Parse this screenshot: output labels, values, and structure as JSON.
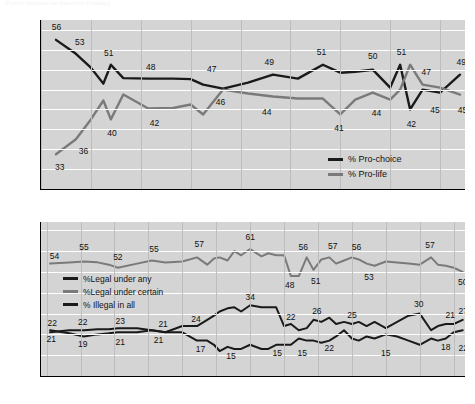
{
  "page": {
    "faint_header": "Public Opinion on Abortion (Gallup)"
  },
  "charts": [
    {
      "id": "chart-pro-choice-pro-life",
      "type": "line",
      "title": "",
      "xlabel": "",
      "ylabel": "",
      "xlim": [
        1995,
        2012
      ],
      "ylim": [
        26,
        60
      ],
      "yticks": [
        26,
        30,
        34,
        38,
        42,
        46,
        50,
        54,
        58
      ],
      "xticks": [
        1995,
        1997,
        1999,
        2001,
        2003,
        2005,
        2007,
        2009,
        2011
      ],
      "grid": "horizontal-and-vertical",
      "legend_position": "bottom-right-inside",
      "series": [
        {
          "name": "% Pro-choice",
          "color": "#1a1a1a",
          "x": [
            1995.6,
            1996.4,
            1997.0,
            1997.5,
            1997.8,
            1998.3,
            1999.3,
            2000.3,
            2001.0,
            2001.5,
            2002.3,
            2003.3,
            2004.3,
            2005.3,
            2006.3,
            2007.0,
            2007.6,
            2008.3,
            2009.0,
            2009.4,
            2009.8,
            2010.3,
            2011.0,
            2011.8
          ],
          "values": [
            56,
            53.2,
            50.4,
            47.2,
            51,
            48.3,
            48.2,
            48.2,
            48.1,
            47,
            46.2,
            47.4,
            49,
            48.2,
            51,
            49.4,
            49.6,
            50,
            46.4,
            51,
            42,
            46,
            45.4,
            49
          ]
        },
        {
          "name": "% Pro-life",
          "color": "#7a7a7a",
          "x": [
            1995.6,
            1996.4,
            1997.0,
            1997.5,
            1997.8,
            1998.3,
            1999.3,
            2000.3,
            2001.0,
            2001.5,
            2002.3,
            2003.3,
            2004.3,
            2005.3,
            2006.3,
            2007.0,
            2007.6,
            2008.3,
            2009.0,
            2009.4,
            2009.8,
            2010.3,
            2011.0,
            2011.8
          ],
          "values": [
            33,
            36,
            40,
            43.8,
            40,
            45,
            42.2,
            42.3,
            43,
            41,
            46,
            45.2,
            44.6,
            44.2,
            44.2,
            41,
            44,
            45.4,
            44,
            46,
            51,
            47,
            46.4,
            45
          ]
        }
      ],
      "data_labels": [
        {
          "text": "56",
          "x": 1995.62,
          "y": 58.6,
          "series": "% Pro-choice"
        },
        {
          "text": "53",
          "x": 1996.55,
          "y": 55.6,
          "series": "% Pro-choice"
        },
        {
          "text": "51",
          "x": 1997.72,
          "y": 53.4,
          "series": "% Pro-choice"
        },
        {
          "text": "48",
          "x": 1999.4,
          "y": 50.5,
          "series": "% Pro-choice"
        },
        {
          "text": "47",
          "x": 2001.85,
          "y": 50.2,
          "series": "% Pro-choice"
        },
        {
          "text": "49",
          "x": 2004.15,
          "y": 51.5,
          "series": "% Pro-choice"
        },
        {
          "text": "51",
          "x": 2006.25,
          "y": 53.6,
          "series": "% Pro-choice"
        },
        {
          "text": "50",
          "x": 2008.3,
          "y": 52.7,
          "series": "% Pro-choice"
        },
        {
          "text": "51",
          "x": 2009.45,
          "y": 53.6,
          "series": "% Pro-choice"
        },
        {
          "text": "47",
          "x": 2010.45,
          "y": 49.6,
          "series": "% Pro-choice"
        },
        {
          "text": "49",
          "x": 2011.85,
          "y": 51.6,
          "series": "% Pro-choice"
        },
        {
          "text": "33",
          "x": 1995.75,
          "y": 30.4,
          "series": "% Pro-life"
        },
        {
          "text": "36",
          "x": 1996.7,
          "y": 33.6,
          "series": "% Pro-life"
        },
        {
          "text": "40",
          "x": 1997.85,
          "y": 37.2,
          "series": "% Pro-life"
        },
        {
          "text": "42",
          "x": 1999.55,
          "y": 39.2,
          "series": "% Pro-life"
        },
        {
          "text": "46",
          "x": 2002.2,
          "y": 43.6,
          "series": "% Pro-life"
        },
        {
          "text": "44",
          "x": 2004.05,
          "y": 41.4,
          "series": "% Pro-life"
        },
        {
          "text": "41",
          "x": 2006.95,
          "y": 38.2,
          "series": "% Pro-life"
        },
        {
          "text": "44",
          "x": 2008.45,
          "y": 41.3,
          "series": "% Pro-life"
        },
        {
          "text": "42",
          "x": 2009.85,
          "y": 39.1,
          "series": "% Pro-life"
        },
        {
          "text": "45",
          "x": 2010.8,
          "y": 41.8,
          "series": "% Pro-life"
        },
        {
          "text": "45",
          "x": 2011.9,
          "y": 41.8,
          "series": "% Pro-life"
        }
      ]
    },
    {
      "id": "chart-legality-of-abortion",
      "type": "line",
      "title": "",
      "xlabel": "",
      "ylabel": "",
      "xlim": [
        1974.5,
        2012
      ],
      "ylim": [
        0,
        74
      ],
      "yticks": [
        0,
        10,
        20,
        30,
        40,
        50,
        60,
        70
      ],
      "xticks": [
        1975,
        1978,
        1981,
        1984,
        1987,
        1990,
        1993,
        1996,
        1999,
        2002,
        2005,
        2008,
        2011
      ],
      "grid": "horizontal-and-vertical",
      "legend_position": "upper-left-inside",
      "series": [
        {
          "name": "%Legal under certain",
          "color": "#7a7a7a",
          "x": [
            1975.3,
            1977.0,
            1978.3,
            1979.5,
            1980.5,
            1981.3,
            1983.0,
            1984.3,
            1985.5,
            1987.0,
            1988.3,
            1989.2,
            1989.8,
            1990.3,
            1991.0,
            1991.6,
            1992.2,
            1993.0,
            1994.0,
            1994.6,
            1995.3,
            1996.0,
            1996.6,
            1997.3,
            1998.0,
            1998.6,
            1999.3,
            2000.0,
            2000.6,
            2001.3,
            2002.0,
            2002.6,
            2003.3,
            2004.0,
            2005.0,
            2006.0,
            2007.0,
            2008.0,
            2009.0,
            2009.6,
            2010.3,
            2011.0,
            2011.8
          ],
          "values": [
            54,
            54.5,
            55,
            54.6,
            53.5,
            52,
            54,
            55.5,
            54.5,
            55,
            57,
            53.5,
            56.5,
            57,
            55.5,
            60,
            58,
            61,
            57.5,
            59,
            58,
            58,
            48,
            48,
            57,
            51,
            56,
            57,
            54,
            55.5,
            57,
            56,
            54,
            53,
            55,
            54.5,
            54,
            53.5,
            57,
            53.5,
            53,
            52,
            50
          ]
        },
        {
          "name": "%Legal under any",
          "color": "#1a1a1a",
          "x": [
            1975.3,
            1977.0,
            1978.3,
            1979.5,
            1980.5,
            1981.3,
            1983.0,
            1984.3,
            1985.5,
            1987.0,
            1988.3,
            1989.2,
            1989.8,
            1990.3,
            1991.0,
            1991.6,
            1992.2,
            1993.0,
            1994.0,
            1994.6,
            1995.3,
            1996.0,
            1996.6,
            1997.3,
            1998.0,
            1998.6,
            1999.3,
            2000.0,
            2000.6,
            2001.3,
            2002.0,
            2002.6,
            2003.3,
            2004.0,
            2005.0,
            2006.0,
            2007.0,
            2008.0,
            2009.0,
            2009.6,
            2010.3,
            2011.0,
            2011.8
          ],
          "values": [
            21,
            22,
            22,
            22.5,
            22.5,
            23,
            23,
            22,
            21,
            24,
            24,
            27,
            29,
            31,
            32.5,
            33,
            31,
            34,
            33,
            33,
            33,
            24,
            25,
            22,
            23,
            27,
            26,
            28,
            25,
            26,
            25,
            26,
            24,
            26,
            23,
            26,
            29,
            30,
            22,
            24,
            25,
            25,
            27
          ]
        },
        {
          "name": "% Illegal in all",
          "color": "#1a1a1a",
          "x": [
            1975.3,
            1977.0,
            1978.3,
            1979.5,
            1980.5,
            1981.3,
            1983.0,
            1984.3,
            1985.5,
            1987.0,
            1988.3,
            1989.2,
            1989.8,
            1990.3,
            1991.0,
            1991.6,
            1992.2,
            1993.0,
            1994.0,
            1994.6,
            1995.3,
            1996.0,
            1996.6,
            1997.3,
            1998.0,
            1998.6,
            1999.3,
            2000.0,
            2000.6,
            2001.3,
            2002.0,
            2002.6,
            2003.3,
            2004.0,
            2005.0,
            2006.0,
            2007.0,
            2008.0,
            2009.0,
            2009.6,
            2010.3,
            2011.0,
            2011.8
          ],
          "values": [
            22,
            20.5,
            19,
            20,
            20.5,
            21,
            21,
            22,
            21,
            21,
            17,
            17,
            15,
            12,
            14,
            13,
            13,
            15,
            13,
            13,
            15,
            15,
            15,
            18,
            17,
            17,
            16,
            17,
            19,
            22,
            18,
            17,
            19,
            18,
            20,
            19,
            17,
            15,
            18,
            17,
            18,
            21,
            22
          ]
        }
      ],
      "data_labels": [
        {
          "text": "54",
          "x": 1975.7,
          "y": 57.5
        },
        {
          "text": "55",
          "x": 1978.3,
          "y": 62.0
        },
        {
          "text": "52",
          "x": 1981.3,
          "y": 57.0
        },
        {
          "text": "55",
          "x": 1984.5,
          "y": 61.0
        },
        {
          "text": "57",
          "x": 1988.5,
          "y": 63.5
        },
        {
          "text": "48",
          "x": 1996.5,
          "y": 43.5
        },
        {
          "text": "61",
          "x": 1993.0,
          "y": 67.0
        },
        {
          "text": "56",
          "x": 1997.7,
          "y": 62.0
        },
        {
          "text": "51",
          "x": 1998.8,
          "y": 45.5
        },
        {
          "text": "57",
          "x": 2000.3,
          "y": 62.5
        },
        {
          "text": "56",
          "x": 2002.4,
          "y": 62.0
        },
        {
          "text": "53",
          "x": 2003.5,
          "y": 47.5
        },
        {
          "text": "57",
          "x": 2008.9,
          "y": 63.0
        },
        {
          "text": "50",
          "x": 2011.8,
          "y": 45.0
        },
        {
          "text": "22",
          "x": 1975.5,
          "y": 25.5
        },
        {
          "text": "22",
          "x": 1978.2,
          "y": 26.0
        },
        {
          "text": "23",
          "x": 1981.5,
          "y": 26.5
        },
        {
          "text": "21",
          "x": 1985.3,
          "y": 25.0
        },
        {
          "text": "24",
          "x": 1988.2,
          "y": 27.5
        },
        {
          "text": "34",
          "x": 1993.0,
          "y": 38.0
        },
        {
          "text": "22",
          "x": 1996.6,
          "y": 28.5
        },
        {
          "text": "26",
          "x": 1998.9,
          "y": 31.0
        },
        {
          "text": "25",
          "x": 2002.0,
          "y": 29.5
        },
        {
          "text": "30",
          "x": 2007.9,
          "y": 34.5
        },
        {
          "text": "21",
          "x": 2010.7,
          "y": 29.5
        },
        {
          "text": "27",
          "x": 2011.85,
          "y": 31.0
        },
        {
          "text": "21",
          "x": 1975.4,
          "y": 18.0
        },
        {
          "text": "19",
          "x": 1978.2,
          "y": 15.5
        },
        {
          "text": "21",
          "x": 1981.5,
          "y": 16.5
        },
        {
          "text": "21",
          "x": 1984.9,
          "y": 17.5
        },
        {
          "text": "17",
          "x": 1988.6,
          "y": 13.0
        },
        {
          "text": "15",
          "x": 1991.3,
          "y": 9.5
        },
        {
          "text": "15",
          "x": 1995.4,
          "y": 11.0
        },
        {
          "text": "15",
          "x": 1997.6,
          "y": 11.0
        },
        {
          "text": "22",
          "x": 2000.0,
          "y": 13.5
        },
        {
          "text": "15",
          "x": 2005.0,
          "y": 11.0
        },
        {
          "text": "18",
          "x": 2010.3,
          "y": 14.0
        },
        {
          "text": "22",
          "x": 2011.85,
          "y": 13.5
        }
      ]
    }
  ]
}
